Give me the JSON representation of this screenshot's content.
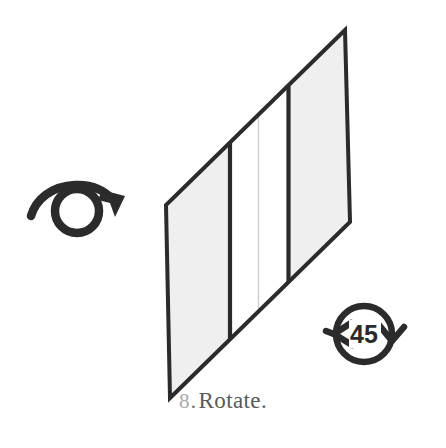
{
  "figure": {
    "caption": {
      "index": "8",
      "separator": ".",
      "label": "Rotate."
    },
    "colors": {
      "background": "#ffffff",
      "panel_fill": "#efefef",
      "panel_stroke": "#2b2b2b",
      "thin_divider": "#cccccc",
      "icon_stroke": "#2b2b2b",
      "caption_index": "#a9a9a9",
      "caption_label": "#595959"
    },
    "elements": {
      "rotate_gesture_icon": {
        "name": "rotate-gesture-icon",
        "description": "circle with sweeping arrow over the top pointing down-right",
        "center_x": 77,
        "center_y": 209,
        "radius": 24
      },
      "angle_badge": {
        "name": "rotation-angle-badge",
        "description": "circle with two arrowheads and numeric angle label",
        "value": "45",
        "unit": "degrees",
        "center_x": 364,
        "center_y": 334,
        "radius": 30
      },
      "rotating_panel": {
        "name": "rotating-panel-shape",
        "description": "parallelogram panel shown in perspective, divided by vertical bands",
        "vertices": [
          {
            "x": 345,
            "y": 30
          },
          {
            "x": 166,
            "y": 205
          },
          {
            "x": 170,
            "y": 398
          },
          {
            "x": 350,
            "y": 222
          }
        ],
        "dividers": [
          {
            "name": "divider-left",
            "x": 230,
            "type": "thick"
          },
          {
            "name": "divider-middle",
            "x": 258,
            "type": "thin"
          },
          {
            "name": "divider-right",
            "x": 288,
            "type": "thick"
          }
        ],
        "bands": [
          {
            "name": "band-left",
            "filled": true
          },
          {
            "name": "band-center",
            "filled": false
          },
          {
            "name": "band-right",
            "filled": true
          }
        ]
      }
    }
  }
}
